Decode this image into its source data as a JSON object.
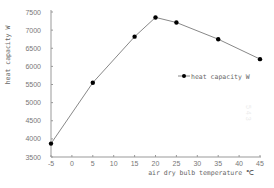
{
  "chart_data": {
    "type": "line",
    "title": "",
    "xlabel": "air dry bulb temperature ℃",
    "ylabel": "heat capacity W",
    "x": [
      -5,
      5,
      15,
      20,
      25,
      35,
      45
    ],
    "series": [
      {
        "name": "heat capacity W",
        "values": [
          3870,
          5550,
          6820,
          7350,
          7210,
          6750,
          6200
        ],
        "marker": "circle",
        "color": "#000000",
        "line_color": "#888888"
      }
    ],
    "xticks": [
      -5,
      0,
      5,
      10,
      15,
      20,
      25,
      30,
      35,
      40,
      45
    ],
    "yticks": [
      3500,
      4000,
      4500,
      5000,
      5500,
      6000,
      6500,
      7000,
      7500
    ],
    "xlim": [
      -5,
      45
    ],
    "ylim": [
      3500,
      7500
    ],
    "grid": false,
    "legend_position": "right-middle"
  },
  "axes": {
    "xlabel": "air dry bulb temperature ℃",
    "ylabel": "heat capacity W",
    "xtick_labels": [
      "-5",
      "0",
      "5",
      "10",
      "15",
      "20",
      "25",
      "30",
      "35",
      "40",
      "45"
    ],
    "ytick_labels": [
      "3500",
      "4000",
      "4500",
      "5000",
      "5500",
      "6000",
      "6500",
      "7000",
      "7500"
    ]
  },
  "legend": {
    "label": "heat capacity W"
  },
  "colors": {
    "axis": "#999999",
    "line": "#888888",
    "marker": "#000000",
    "text": "#777777"
  }
}
